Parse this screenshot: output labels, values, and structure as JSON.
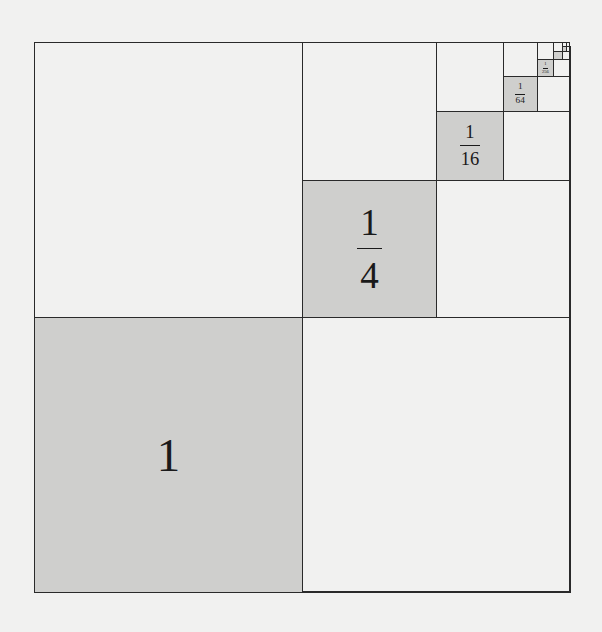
{
  "figure": {
    "colors": {
      "background": "#f1f1f0",
      "shaded": "#cfcfcd",
      "line": "#2a2a2a"
    },
    "levels": [
      {
        "label_whole": "1",
        "numerator": "",
        "denominator": ""
      },
      {
        "label_whole": "",
        "numerator": "1",
        "denominator": "4"
      },
      {
        "label_whole": "",
        "numerator": "1",
        "denominator": "16"
      },
      {
        "label_whole": "",
        "numerator": "1",
        "denominator": "64"
      },
      {
        "label_whole": "",
        "numerator": "1",
        "denominator": "256"
      },
      {
        "label_whole": "",
        "numerator": "",
        "denominator": ""
      },
      {
        "label_whole": "",
        "numerator": "",
        "denominator": ""
      }
    ]
  }
}
